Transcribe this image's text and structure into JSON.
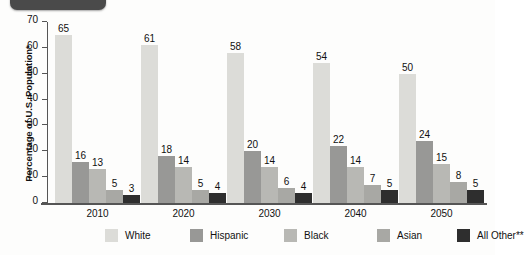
{
  "ylabel": "Percentage of U.S. Population*",
  "yticks": [
    0,
    10,
    20,
    30,
    40,
    50,
    60,
    70
  ],
  "legend": [
    {
      "label": "White",
      "color": "#dcdcd8"
    },
    {
      "label": "Hispanic",
      "color": "#989896"
    },
    {
      "label": "Black",
      "color": "#b8b8b4"
    },
    {
      "label": "Asian",
      "color": "#a8a8a4"
    },
    {
      "label": "All Other**",
      "color": "#2e2e2e"
    }
  ],
  "chart_data": {
    "type": "bar",
    "title": "",
    "xlabel": "",
    "ylabel": "Percentage of U.S. Population*",
    "ylim": [
      0,
      70
    ],
    "ytick_step": 10,
    "grid": false,
    "legend_position": "bottom",
    "categories": [
      "2010",
      "2020",
      "2030",
      "2040",
      "2050"
    ],
    "series": [
      {
        "name": "White",
        "color": "#dcdcd8",
        "values": [
          65,
          61,
          58,
          54,
          50
        ]
      },
      {
        "name": "Hispanic",
        "color": "#989896",
        "values": [
          16,
          18,
          20,
          22,
          24
        ]
      },
      {
        "name": "Black",
        "color": "#b8b8b4",
        "values": [
          13,
          14,
          14,
          14,
          15
        ]
      },
      {
        "name": "Asian",
        "color": "#a8a8a4",
        "values": [
          5,
          5,
          6,
          7,
          8
        ]
      },
      {
        "name": "All Other**",
        "color": "#2e2e2e",
        "values": [
          3,
          4,
          4,
          5,
          5
        ]
      }
    ]
  }
}
